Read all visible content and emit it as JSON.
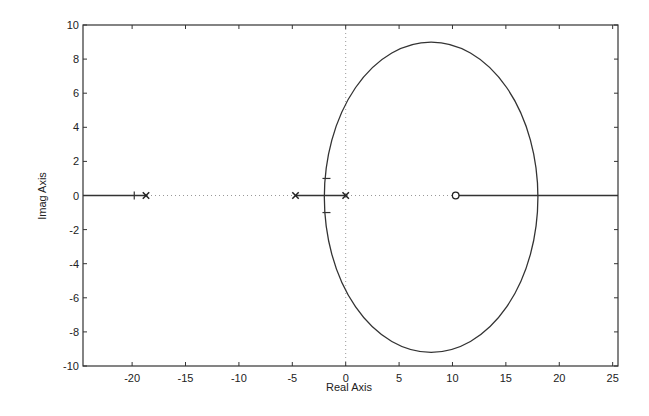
{
  "chart_data": {
    "type": "line",
    "title": "",
    "xlabel": "Real Axis",
    "ylabel": "Imag Axis",
    "xlim": [
      -24.6,
      25.5
    ],
    "ylim": [
      -10,
      10
    ],
    "xticks": [
      -20,
      -15,
      -10,
      -5,
      0,
      5,
      10,
      15,
      20,
      25
    ],
    "yticks": [
      -10,
      -8,
      -6,
      -4,
      -2,
      0,
      2,
      4,
      6,
      8,
      10
    ],
    "xtick_labels": [
      "-20",
      "-15",
      "-10",
      "-5",
      "0",
      "5",
      "10",
      "15",
      "20",
      "25"
    ],
    "ytick_labels": [
      "-10",
      "-8",
      "-6",
      "-4",
      "-2",
      "0",
      "2",
      "4",
      "6",
      "8",
      "10"
    ],
    "grid": false,
    "legend": null,
    "poles": [
      {
        "x": -18.7,
        "y": 0
      },
      {
        "x": -4.7,
        "y": 0
      },
      {
        "x": 0,
        "y": 0
      }
    ],
    "zeros": [
      {
        "x": 10.3,
        "y": 0
      }
    ],
    "series": [
      {
        "name": "locus-branch-left",
        "x": [
          -24.6,
          -18.7
        ],
        "y": [
          0,
          0
        ]
      },
      {
        "name": "locus-branch-pole-pair",
        "x": [
          -4.7,
          0
        ],
        "y": [
          0,
          0
        ]
      },
      {
        "name": "locus-circle",
        "shape": "ellipse",
        "center": [
          8.0,
          0
        ],
        "x_radius": 10.0,
        "y_radius": 9.1,
        "x_range": [
          -2.0,
          18.0
        ],
        "y_range": [
          -9.2,
          9.0
        ]
      },
      {
        "name": "locus-branch-zero",
        "x": [
          10.3,
          25.5
        ],
        "y": [
          0,
          0
        ]
      }
    ],
    "markers": [
      {
        "type": "tick",
        "x": -19.8,
        "y": 0
      },
      {
        "type": "tick",
        "x": -1.8,
        "y": 1.0
      },
      {
        "type": "tick",
        "x": -1.8,
        "y": -1.0
      }
    ],
    "reference_lines": [
      {
        "type": "dotted",
        "orientation": "horizontal",
        "y": 0
      },
      {
        "type": "dotted",
        "orientation": "vertical",
        "x": 0
      }
    ]
  }
}
